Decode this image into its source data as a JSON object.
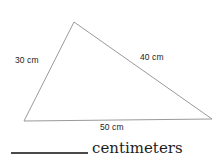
{
  "figure": {
    "shape": "triangle",
    "stroke_color": "#9a9a9a",
    "stroke_width": 1,
    "fill_color": "#ffffff",
    "background_color": "#ffffff",
    "vertices": {
      "apex": [
        74,
        22
      ],
      "bottom_left": [
        24,
        121
      ],
      "right": [
        212,
        119
      ]
    },
    "labels": {
      "left_side": "30 cm",
      "right_side": "40 cm",
      "base": "50 cm"
    }
  },
  "answer": {
    "blank_line": "",
    "unit_label": "centimeters",
    "line_color": "#4a4a4a"
  }
}
